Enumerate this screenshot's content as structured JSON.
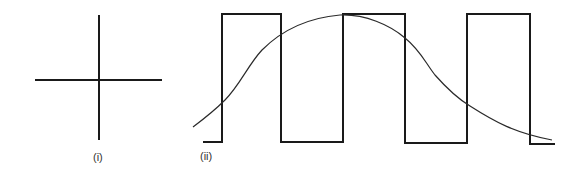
{
  "figure": {
    "panels": [
      {
        "id": "i",
        "label": "(i)",
        "description": "Cross formed by a horizontal and a vertical line",
        "horizontal_line": {
          "x1": 35,
          "y1": 80,
          "x2": 162,
          "y2": 80
        },
        "vertical_line": {
          "x1": 99,
          "y1": 15,
          "x2": 99,
          "y2": 140
        }
      },
      {
        "id": "ii",
        "label": "(ii)",
        "description": "Square wave with superimposed smooth bell-shaped curve",
        "square_wave_points": "203,142 222,142 222,14 281,14 281,142 343,142 343,14 405,14 405,143 467,143 467,14 530,14 530,144 555,144",
        "curve_path": "M193,127 C205,118 215,110 225,100 C240,85 248,65 262,50 C280,32 305,18 340,15 C365,14 390,25 405,38 C420,50 425,62 435,75 C450,92 460,100 470,106 C495,122 515,133 552,140"
      }
    ],
    "stroke_color": "#1a1a1a",
    "curve_color": "#2a2a2a",
    "label_color": "#333333"
  }
}
